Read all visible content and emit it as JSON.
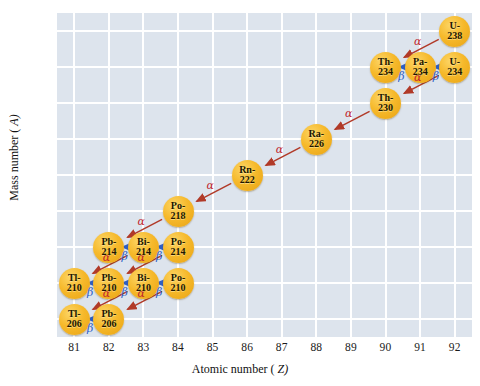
{
  "chart_data": {
    "type": "scatter",
    "title": "",
    "xlabel": "Atomic number (Z)",
    "ylabel": "Mass number (A)",
    "xlim": [
      80.5,
      92.5
    ],
    "ylim": [
      204,
      240
    ],
    "xticks": [
      81,
      82,
      83,
      84,
      85,
      86,
      87,
      88,
      89,
      90,
      91,
      92
    ],
    "yticks": [
      206,
      210,
      214,
      218,
      222,
      226,
      230,
      234,
      238
    ],
    "grid": true,
    "legend": null,
    "colors": {
      "node_fill": "#f6b92b",
      "plot_background": "#dde4ed",
      "gridline": "#ffffff",
      "alpha_arrow": "#b13a28",
      "beta_arrow": "#2f5fc4",
      "alpha_label": "#c1272d",
      "beta_label": "#2f5fc4"
    },
    "nodes": [
      {
        "id": "U-238",
        "element": "U-",
        "mass": "238",
        "z": 92,
        "a": 238
      },
      {
        "id": "Th-234",
        "element": "Th-",
        "mass": "234",
        "z": 90,
        "a": 234
      },
      {
        "id": "Pa-234",
        "element": "Pa-",
        "mass": "234",
        "z": 91,
        "a": 234
      },
      {
        "id": "U-234",
        "element": "U-",
        "mass": "234",
        "z": 92,
        "a": 234
      },
      {
        "id": "Th-230",
        "element": "Th-",
        "mass": "230",
        "z": 90,
        "a": 230
      },
      {
        "id": "Ra-226",
        "element": "Ra-",
        "mass": "226",
        "z": 88,
        "a": 226
      },
      {
        "id": "Rn-222",
        "element": "Rn-",
        "mass": "222",
        "z": 86,
        "a": 222
      },
      {
        "id": "Po-218",
        "element": "Po-",
        "mass": "218",
        "z": 84,
        "a": 218
      },
      {
        "id": "Pb-214",
        "element": "Pb-",
        "mass": "214",
        "z": 82,
        "a": 214
      },
      {
        "id": "Bi-214",
        "element": "Bi-",
        "mass": "214",
        "z": 83,
        "a": 214
      },
      {
        "id": "Po-214",
        "element": "Po-",
        "mass": "214",
        "z": 84,
        "a": 214
      },
      {
        "id": "Tl-210",
        "element": "Tl-",
        "mass": "210",
        "z": 81,
        "a": 210
      },
      {
        "id": "Pb-210",
        "element": "Pb-",
        "mass": "210",
        "z": 82,
        "a": 210
      },
      {
        "id": "Bi-210",
        "element": "Bi-",
        "mass": "210",
        "z": 83,
        "a": 210
      },
      {
        "id": "Po-210",
        "element": "Po-",
        "mass": "210",
        "z": 84,
        "a": 210
      },
      {
        "id": "Tl-206",
        "element": "Tl-",
        "mass": "206",
        "z": 81,
        "a": 206
      },
      {
        "id": "Pb-206",
        "element": "Pb-",
        "mass": "206",
        "z": 82,
        "a": 206
      }
    ],
    "decays": [
      {
        "from": "U-238",
        "to": "Th-234",
        "type": "alpha",
        "label": "α"
      },
      {
        "from": "Th-234",
        "to": "Pa-234",
        "type": "beta",
        "label": "β"
      },
      {
        "from": "Pa-234",
        "to": "U-234",
        "type": "beta",
        "label": "β"
      },
      {
        "from": "U-234",
        "to": "Th-230",
        "type": "alpha",
        "label": "α"
      },
      {
        "from": "Th-230",
        "to": "Ra-226",
        "type": "alpha",
        "label": "α"
      },
      {
        "from": "Ra-226",
        "to": "Rn-222",
        "type": "alpha",
        "label": "α"
      },
      {
        "from": "Rn-222",
        "to": "Po-218",
        "type": "alpha",
        "label": "α"
      },
      {
        "from": "Po-218",
        "to": "Pb-214",
        "type": "alpha",
        "label": "α"
      },
      {
        "from": "Pb-214",
        "to": "Bi-214",
        "type": "beta",
        "label": "β"
      },
      {
        "from": "Bi-214",
        "to": "Po-214",
        "type": "beta",
        "label": "β"
      },
      {
        "from": "Bi-214",
        "to": "Tl-210",
        "type": "alpha",
        "label": "α"
      },
      {
        "from": "Po-214",
        "to": "Pb-210",
        "type": "alpha",
        "label": "α"
      },
      {
        "from": "Tl-210",
        "to": "Pb-210",
        "type": "beta",
        "label": "β"
      },
      {
        "from": "Pb-210",
        "to": "Bi-210",
        "type": "beta",
        "label": "β"
      },
      {
        "from": "Bi-210",
        "to": "Po-210",
        "type": "beta",
        "label": "β"
      },
      {
        "from": "Bi-210",
        "to": "Tl-206",
        "type": "alpha",
        "label": "α"
      },
      {
        "from": "Po-210",
        "to": "Pb-206",
        "type": "alpha",
        "label": "α"
      },
      {
        "from": "Tl-206",
        "to": "Pb-206",
        "type": "beta",
        "label": "β"
      }
    ]
  }
}
